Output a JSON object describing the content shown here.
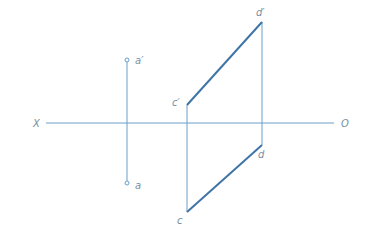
{
  "diagram": {
    "type": "orthographic-projection",
    "colors": {
      "line": "#4a7fb0",
      "axis": "#6a9fc8",
      "label": "#7a8fa0"
    },
    "axis": {
      "left_label": "X",
      "right_label": "O"
    },
    "points": {
      "a_prime": {
        "label": "a′"
      },
      "a": {
        "label": "a"
      },
      "c_prime": {
        "label": "c′"
      },
      "c": {
        "label": "c"
      },
      "d_prime": {
        "label": "d′"
      },
      "d": {
        "label": "d"
      }
    }
  }
}
